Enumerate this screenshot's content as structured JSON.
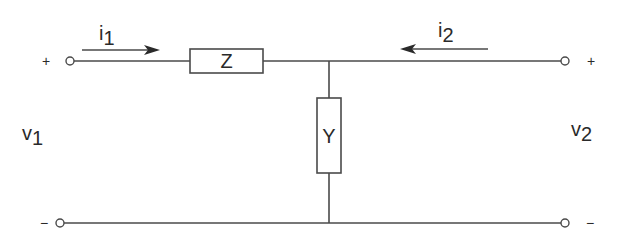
{
  "diagram": {
    "type": "two-port network (L-section)",
    "components": {
      "series": {
        "label": "Z"
      },
      "shunt": {
        "label": "Y"
      }
    },
    "currents": [
      {
        "symbol": "i",
        "subscript": "1",
        "direction": "right"
      },
      {
        "symbol": "i",
        "subscript": "2",
        "direction": "left"
      }
    ],
    "voltages": [
      {
        "symbol": "v",
        "subscript": "1"
      },
      {
        "symbol": "v",
        "subscript": "2"
      }
    ],
    "terminals": {
      "left_top_sign": "+",
      "left_bottom_sign": "−",
      "right_top_sign": "+",
      "right_bottom_sign": "−"
    },
    "colors": {
      "line": "#4a4a4a",
      "text": "#2a2a2a",
      "background": "#ffffff"
    }
  }
}
